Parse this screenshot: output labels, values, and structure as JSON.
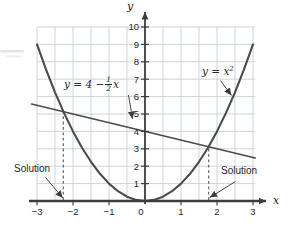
{
  "chart_data": {
    "type": "line",
    "title": "",
    "xlabel": "x",
    "ylabel": "y",
    "xlim": [
      -3,
      3
    ],
    "ylim": [
      0,
      10
    ],
    "x_ticks": [
      -3,
      -2,
      -1,
      0,
      1,
      2,
      3
    ],
    "y_ticks": [
      1,
      2,
      3,
      4,
      5,
      6,
      7,
      8,
      9,
      10
    ],
    "grid": {
      "on": true,
      "x_step": 0.5,
      "y_step": 1,
      "color": "#c6d0d8"
    },
    "legend": "none",
    "series": [
      {
        "name": "y = x2 (parabola)",
        "expression": "y = x^2",
        "color": "#4b4b4b",
        "x": [
          -3,
          -2.75,
          -2.5,
          -2.25,
          -2,
          -1.75,
          -1.5,
          -1.25,
          -1,
          -0.75,
          -0.5,
          -0.25,
          0,
          0.25,
          0.5,
          0.75,
          1,
          1.25,
          1.5,
          1.75,
          2,
          2.25,
          2.5,
          2.75,
          3
        ],
        "y": [
          9,
          7.5625,
          6.25,
          5.0625,
          4,
          3.0625,
          2.25,
          1.5625,
          1,
          0.5625,
          0.25,
          0.0625,
          0,
          0.0625,
          0.25,
          0.5625,
          1,
          1.5625,
          2.25,
          3.0625,
          4,
          5.0625,
          6.25,
          7.5625,
          9
        ]
      },
      {
        "name": "y = 4 - (1/2)x (line)",
        "expression": "y = 4 - (1/2)x",
        "color": "#4b4b4b",
        "x": [
          -3.15,
          3.06
        ],
        "y": [
          5.575,
          2.47
        ]
      }
    ],
    "solutions": [
      {
        "label": "Solution",
        "x": -2.27,
        "y": 5.13
      },
      {
        "label": "Solution",
        "x": 1.77,
        "y": 3.12
      }
    ]
  },
  "annotations": {
    "line_eq": {
      "prefix": "y = 4 −",
      "frac_num": "1",
      "frac_den": "2",
      "suffix": "x"
    },
    "parabola_eq": {
      "base": "y = x",
      "exp": "2"
    },
    "solution_left": "Solution",
    "solution_right": "Solution"
  }
}
